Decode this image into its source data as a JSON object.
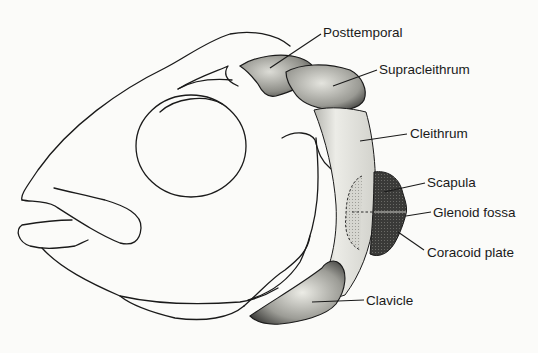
{
  "diagram": {
    "labels": [
      {
        "id": "posttemporal",
        "text": "Posttemporal",
        "x": 323,
        "y": 28
      },
      {
        "id": "supracleithrum",
        "text": "Supracleithrum",
        "x": 380,
        "y": 64
      },
      {
        "id": "cleithrum",
        "text": "Cleithrum",
        "x": 410,
        "y": 128
      },
      {
        "id": "scapula",
        "text": "Scapula",
        "x": 427,
        "y": 178
      },
      {
        "id": "glenoid-fossa",
        "text": "Glenoid fossa",
        "x": 433,
        "y": 207
      },
      {
        "id": "coracoid-plate",
        "text": "Coracoid plate",
        "x": 427,
        "y": 248
      },
      {
        "id": "clavicle",
        "text": "Clavicle",
        "x": 366,
        "y": 297
      }
    ],
    "colors": {
      "outline": "#1a1a1a",
      "light_stipple": "#d9d9d4",
      "mid_stipple": "#a9a9a3",
      "dark_fill": "#3d3d3a",
      "background": "#fbfbf9"
    }
  }
}
